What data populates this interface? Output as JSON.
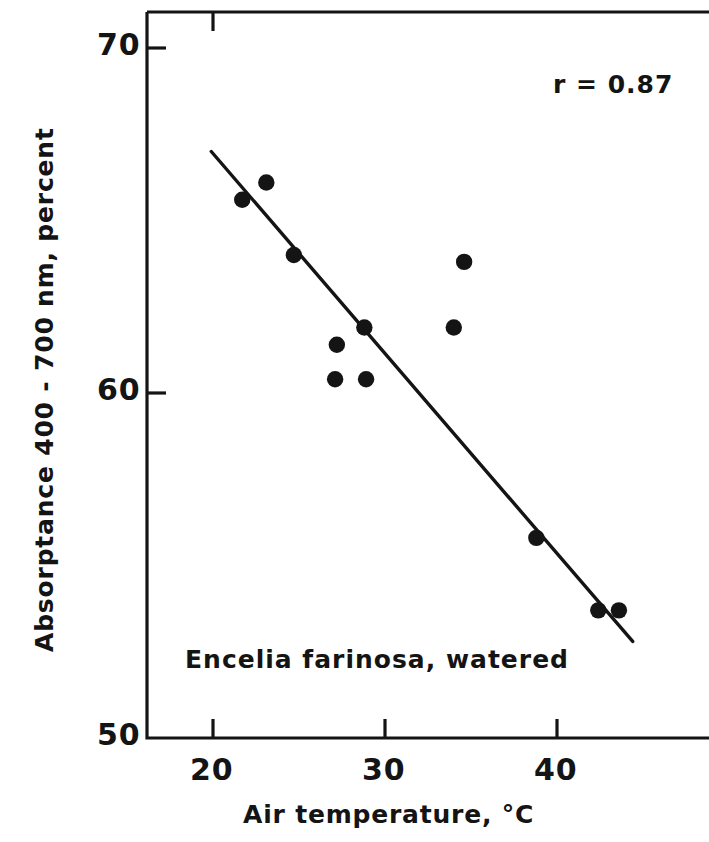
{
  "figure": {
    "background_color": "#ffffff",
    "ink_color": "#141414"
  },
  "chart_data": {
    "type": "scatter",
    "title": "",
    "xlabel": "Air temperature, °C",
    "ylabel": "Absorptance 400 - 700 nm, percent",
    "xlim": [
      17.0,
      45.2
    ],
    "ylim": [
      50.0,
      70.8
    ],
    "xticks": [
      20,
      30,
      40
    ],
    "xtick_labels": [
      "20",
      "30",
      "40"
    ],
    "yticks": [
      50,
      60,
      70
    ],
    "ytick_labels": [
      "50",
      "60",
      "70"
    ],
    "grid": false,
    "legend": null,
    "marker": "filled-circle",
    "marker_color": "#141414",
    "x": [
      21.7,
      23.1,
      24.7,
      27.1,
      27.2,
      28.8,
      28.9,
      34.0,
      34.6,
      38.8,
      42.4,
      43.6
    ],
    "y": [
      65.6,
      66.1,
      64.0,
      60.4,
      61.4,
      61.9,
      60.4,
      61.9,
      63.8,
      55.8,
      53.7,
      53.7
    ],
    "points": [
      {
        "x": 21.7,
        "y": 65.6
      },
      {
        "x": 23.1,
        "y": 66.1
      },
      {
        "x": 24.7,
        "y": 64.0
      },
      {
        "x": 27.1,
        "y": 60.4
      },
      {
        "x": 27.2,
        "y": 61.4
      },
      {
        "x": 28.8,
        "y": 61.9
      },
      {
        "x": 28.9,
        "y": 60.4
      },
      {
        "x": 34.0,
        "y": 61.9
      },
      {
        "x": 34.6,
        "y": 63.8
      },
      {
        "x": 38.8,
        "y": 55.8
      },
      {
        "x": 42.4,
        "y": 53.7
      },
      {
        "x": 43.6,
        "y": 53.7
      }
    ],
    "fit_line": {
      "type": "linear-regression",
      "x_start": 19.9,
      "y_start": 67.0,
      "x_end": 44.4,
      "y_end": 52.8
    },
    "annotations": [
      {
        "name": "correlation",
        "text": "r = 0.87",
        "x": 40.2,
        "y": 69.1
      },
      {
        "name": "species-label",
        "text": "Encelia farinosa,  watered",
        "x": 18.5,
        "y": 52.1
      }
    ]
  },
  "axis_labels": {
    "x_title": "Air temperature, °C",
    "y_title": "Absorptance 400 - 700 nm, percent",
    "x_ticks": [
      "20",
      "30",
      "40"
    ],
    "y_ticks": [
      "70",
      "60",
      "50"
    ]
  },
  "annotations": {
    "correlation_text": "r = 0.87",
    "species_text": "Encelia farinosa,  watered"
  }
}
